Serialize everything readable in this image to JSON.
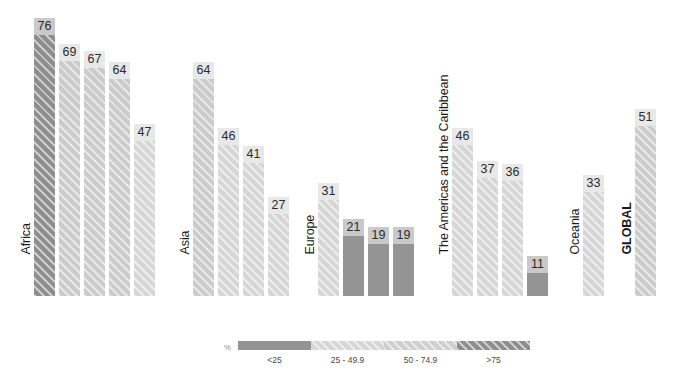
{
  "chart_data": {
    "type": "bar",
    "title": "",
    "subtitle": "",
    "xlabel": "",
    "ylabel": "",
    "ylim": [
      0,
      80
    ],
    "grid": false,
    "legend_position": "bottom",
    "value_unit": "%",
    "categories": [
      "Middle Africa",
      "Eastern Africa",
      "Western Africa",
      "Southern Africa",
      "Northern Africa",
      "South-Central Asia",
      "South-Eastern Asia",
      "Western Asia",
      "Eastern Asia",
      "Eastern Europe",
      "Southern Europe",
      "Northern Europe",
      "Western Europe",
      "Caribbean",
      "Central America",
      "South America",
      "Northern America",
      "Oceania",
      "GLOBAL"
    ],
    "values": [
      76,
      69,
      67,
      64,
      47,
      64,
      46,
      41,
      27,
      31,
      21,
      19,
      19,
      46,
      37,
      36,
      11,
      33,
      51
    ],
    "groups": [
      {
        "name": "Africa",
        "label": "Africa",
        "bold": false,
        "bars": [
          {
            "label_line1": "Middle",
            "label_line2": "Africa",
            "value": 76,
            "class": ">75"
          },
          {
            "label_line1": "Eastern",
            "label_line2": "Africa",
            "value": 69,
            "class": "50 - 74.9"
          },
          {
            "label_line1": "Western",
            "label_line2": "Africa",
            "value": 67,
            "class": "50 - 74.9"
          },
          {
            "label_line1": "Southern",
            "label_line2": "Africa",
            "value": 64,
            "class": "50 - 74.9"
          },
          {
            "label_line1": "Northern",
            "label_line2": "Africa",
            "value": 47,
            "class": "25 - 49.9"
          }
        ]
      },
      {
        "name": "Asia",
        "label": "Asia",
        "bold": false,
        "bars": [
          {
            "label_line1": "South-",
            "label_line2": "Central Asia",
            "value": 64,
            "class": "50 - 74.9"
          },
          {
            "label_line1": "South-",
            "label_line2": "Eastern Asia",
            "value": 46,
            "class": "25 - 49.9"
          },
          {
            "label_line1": "Western",
            "label_line2": "Asia",
            "value": 41,
            "class": "25 - 49.9"
          },
          {
            "label_line1": "Eastern",
            "label_line2": "Asia",
            "value": 27,
            "class": "25 - 49.9"
          }
        ]
      },
      {
        "name": "Europe",
        "label": "Europe",
        "bold": false,
        "bars": [
          {
            "label_line1": "Eastern",
            "label_line2": "Europe",
            "value": 31,
            "class": "25 - 49.9"
          },
          {
            "label_line1": "Southern",
            "label_line2": "Europe",
            "value": 21,
            "class": "<25"
          },
          {
            "label_line1": "Northern",
            "label_line2": "Europe",
            "value": 19,
            "class": "<25"
          },
          {
            "label_line1": "Western",
            "label_line2": "Europe",
            "value": 19,
            "class": "<25"
          }
        ]
      },
      {
        "name": "The Americas and the Caribbean",
        "label": "The Americas and the Caribbean",
        "bold": false,
        "bars": [
          {
            "label_line1": "Caribbean",
            "label_line2": "",
            "value": 46,
            "class": "25 - 49.9"
          },
          {
            "label_line1": "Central",
            "label_line2": "America",
            "value": 37,
            "class": "25 - 49.9"
          },
          {
            "label_line1": "South",
            "label_line2": "America",
            "value": 36,
            "class": "25 - 49.9"
          },
          {
            "label_line1": "Northern",
            "label_line2": "America",
            "value": 11,
            "class": "<25"
          }
        ]
      },
      {
        "name": "Oceania",
        "label": "Oceania",
        "bold": false,
        "bars": [
          {
            "label_line1": "Oceania",
            "label_line2": "",
            "value": 33,
            "class": "25 - 49.9"
          }
        ]
      },
      {
        "name": "GLOBAL",
        "label": "GLOBAL",
        "bold": true,
        "bars": [
          {
            "label_line1": "GLOBAL",
            "label_line2": "",
            "value": 51,
            "class": "50 - 74.9"
          }
        ]
      }
    ]
  },
  "legend": {
    "unit_label": "%",
    "entries": [
      {
        "label": "<25",
        "color": "#949494"
      },
      {
        "label": "25 - 49.9",
        "color": "#d6d6d6"
      },
      {
        "label": "50 - 74.9",
        "color": "#cfcfcf"
      },
      {
        "label": ">75",
        "color": "#8e8e8e"
      }
    ]
  },
  "colors": {
    "lt25": "#949494",
    "c25_49": "#d6d6d6",
    "c50_74": "#cbcbcb",
    "gt75": "#8e8e8e",
    "value_chip": "#e8e8e8",
    "value_chip_dark": "#c9c9c9",
    "sub_label": "#8c8c8c",
    "region_label": "#1a1a1a",
    "background": "#ffffff"
  }
}
